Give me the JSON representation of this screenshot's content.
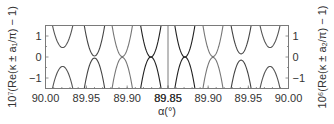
{
  "chart_data": {
    "type": "line",
    "title": "",
    "xlabel": "α(°)",
    "panels": [
      {
        "name": "left",
        "ylabel": "10⁷(Re(κ ± a₁/π) − 1)",
        "xlim": [
          90.0,
          89.85
        ],
        "ylim": [
          -1.5,
          1.5
        ],
        "xticks": [
          90.0,
          89.95,
          89.9,
          89.85
        ],
        "xtick_labels": [
          "90.00",
          "89.95",
          "89.90",
          "89.85"
        ],
        "yticks": [
          1,
          0,
          -1
        ],
        "ytick_labels": [
          "1",
          "0",
          "−1"
        ],
        "series": [
          {
            "name": "pair-1",
            "center": 89.979,
            "gap": 0.45,
            "curvature": 1.0,
            "color": "#555555"
          },
          {
            "name": "pair-2",
            "center": 89.94,
            "gap": 0.05,
            "curvature": 1.0,
            "color": "#444444"
          },
          {
            "name": "pair-3",
            "center": 89.906,
            "gap": 0.02,
            "curvature": 1.0,
            "color": "#777777"
          },
          {
            "name": "pair-4",
            "center": 89.871,
            "gap": 0.0,
            "curvature": 1.0,
            "color": "#222222"
          }
        ]
      },
      {
        "name": "right",
        "ylabel": "10⁶(Re(κ ± a₂/π) − 1)",
        "xlim": [
          89.85,
          90.0
        ],
        "ylim": [
          -1.5,
          1.5
        ],
        "xticks": [
          89.85,
          89.9,
          89.95,
          90.0
        ],
        "xtick_labels": [
          "89.85",
          "89.90",
          "89.95",
          "90.00"
        ],
        "yticks": [
          1,
          0,
          -1
        ],
        "ytick_labels": [
          "1",
          "0",
          "−1"
        ],
        "series": [
          {
            "name": "pair-1",
            "center": 89.871,
            "gap": 0.0,
            "curvature": 1.0,
            "color": "#222222"
          },
          {
            "name": "pair-2",
            "center": 89.906,
            "gap": 0.02,
            "curvature": 1.0,
            "color": "#777777"
          },
          {
            "name": "pair-3",
            "center": 89.941,
            "gap": 0.15,
            "curvature": 1.0,
            "color": "#444444"
          },
          {
            "name": "pair-4",
            "center": 89.977,
            "gap": 0.45,
            "curvature": 1.0,
            "color": "#555555"
          }
        ]
      }
    ]
  }
}
